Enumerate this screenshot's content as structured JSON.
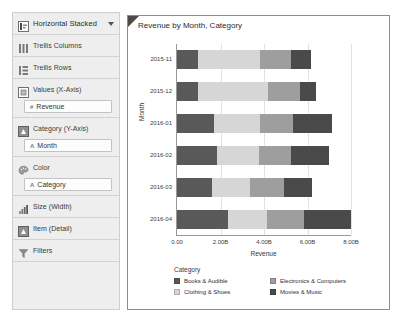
{
  "sidebar": {
    "chart_type": {
      "label": "Horizontal Stacked",
      "icon": "bar-chart-icon",
      "caret": "chevron-down-icon"
    },
    "shelves": [
      {
        "label": "Trellis Columns",
        "icon": "trellis-columns-icon",
        "pills": []
      },
      {
        "label": "Trellis Rows",
        "icon": "trellis-rows-icon",
        "pills": []
      },
      {
        "label": "Values (X-Axis)",
        "icon": "values-axis-icon",
        "pills": [
          {
            "glyph": "#",
            "text": "Revenue"
          }
        ]
      },
      {
        "label": "Category (Y-Axis)",
        "icon": "category-axis-icon",
        "pills": [
          {
            "glyph": "A",
            "text": "Month"
          }
        ]
      },
      {
        "label": "Color",
        "icon": "color-palette-icon",
        "pills": [
          {
            "glyph": "A",
            "text": "Category"
          }
        ]
      },
      {
        "label": "Size (Width)",
        "icon": "size-width-icon",
        "pills": []
      },
      {
        "label": "Item (Detail)",
        "icon": "item-detail-icon",
        "pills": []
      },
      {
        "label": "Filters",
        "icon": "filter-funnel-icon",
        "pills": []
      }
    ]
  },
  "chart_data": {
    "type": "bar",
    "orientation": "horizontal",
    "stacked": true,
    "title": "Revenue by Month, Category",
    "xlabel": "Revenue",
    "ylabel": "Month",
    "categories": [
      "2015-11",
      "2015-12",
      "2016-01",
      "2016-02",
      "2016-03",
      "2016-04"
    ],
    "xlim": [
      0,
      8
    ],
    "xticks": [
      0,
      2,
      4,
      6,
      8
    ],
    "xticklabels": [
      "0.00",
      "2.00B",
      "4.00B",
      "6.00B",
      "8.00B"
    ],
    "grid": true,
    "legend_title": "Category",
    "legend_position": "bottom",
    "series": [
      {
        "name": "Books & Audible",
        "color": "#595959",
        "values": [
          0.95,
          0.95,
          1.7,
          1.85,
          1.6,
          2.35
        ]
      },
      {
        "name": "Clothing & Shoes",
        "color": "#d6d6d6",
        "values": [
          2.85,
          3.25,
          2.1,
          1.9,
          1.75,
          1.8
        ]
      },
      {
        "name": "Electronics & Computers",
        "color": "#9e9e9e",
        "values": [
          1.45,
          1.45,
          1.55,
          1.5,
          1.55,
          1.7
        ]
      },
      {
        "name": "Movies & Music",
        "color": "#4a4a4a",
        "values": [
          0.9,
          0.75,
          1.8,
          1.75,
          1.3,
          2.15
        ]
      }
    ]
  }
}
